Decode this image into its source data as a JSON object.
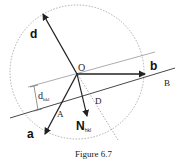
{
  "figure": {
    "caption": "Figure 6.7",
    "labels": {
      "origin": "O",
      "vector_a": "a",
      "vector_b": "b",
      "vector_d": "d",
      "normal_main": "N",
      "normal_sub": "hkl",
      "spacing_main": "d",
      "spacing_sub": "hkl",
      "point_A": "A",
      "point_D": "D",
      "plane_B": "B"
    },
    "colors": {
      "stroke": "#222222",
      "thin": "#777777",
      "dashed": "#9a9a9a"
    }
  }
}
